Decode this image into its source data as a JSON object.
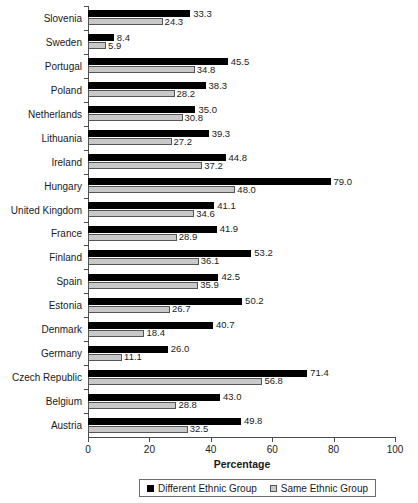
{
  "chart_data": {
    "type": "bar",
    "orientation": "horizontal",
    "title": "",
    "xlabel": "Percentage",
    "ylabel": "",
    "xlim": [
      0,
      100
    ],
    "xticks": [
      0,
      20,
      40,
      60,
      80,
      100
    ],
    "grid": false,
    "legend_position": "bottom",
    "categories": [
      "Slovenia",
      "Sweden",
      "Portugal",
      "Poland",
      "Netherlands",
      "Lithuania",
      "Ireland",
      "Hungary",
      "United Kingdom",
      "France",
      "Finland",
      "Spain",
      "Estonia",
      "Denmark",
      "Germany",
      "Czech Republic",
      "Belgium",
      "Austria"
    ],
    "series": [
      {
        "name": "Different Ethnic Group",
        "color": "#000000",
        "values": [
          33.3,
          8.4,
          45.5,
          38.3,
          35.0,
          39.3,
          44.8,
          79.0,
          41.1,
          41.9,
          53.2,
          42.5,
          50.2,
          40.7,
          26.0,
          71.4,
          43.0,
          49.8
        ],
        "labels": [
          "33.3",
          "8.4",
          "45.5",
          "38.3",
          "35.0",
          "39.3",
          "44.8",
          "79.0",
          "41.1",
          "41.9",
          "53.2",
          "42.5",
          "50.2",
          "40.7",
          "26.0",
          "71.4",
          "43.0",
          "49.8"
        ]
      },
      {
        "name": "Same Ethnic Group",
        "color": "#c9c9c9",
        "values": [
          24.3,
          5.9,
          34.8,
          28.2,
          30.8,
          27.2,
          37.2,
          48.0,
          34.6,
          28.9,
          36.1,
          35.9,
          26.7,
          18.4,
          11.1,
          56.8,
          28.8,
          32.5
        ],
        "labels": [
          "24.3",
          "5.9",
          "34.8",
          "28.2",
          "30.8",
          "27.2",
          "37.2",
          "48.0",
          "34.6",
          "28.9",
          "36.1",
          "35.9",
          "26.7",
          "18.4",
          "11.1",
          "56.8",
          "28.8",
          "32.5"
        ]
      }
    ]
  },
  "axis": {
    "x_title": "Percentage",
    "tick_labels": [
      "0",
      "20",
      "40",
      "60",
      "80",
      "100"
    ]
  },
  "legend": {
    "items": [
      {
        "label": "Different Ethnic Group",
        "color": "#000000"
      },
      {
        "label": "Same Ethnic Group",
        "color": "#c9c9c9"
      }
    ]
  }
}
